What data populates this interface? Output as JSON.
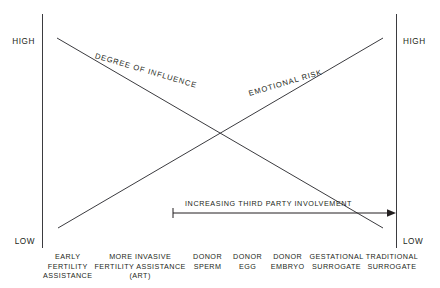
{
  "chart_data": {
    "type": "line",
    "title": "",
    "subtitle": "",
    "xlabel": "",
    "ylabel": "",
    "grid": false,
    "legend_position": "inline-along-lines",
    "axis_scale_labels": {
      "left_top": "HIGH",
      "left_bottom": "LOW",
      "right_top": "HIGH",
      "right_bottom": "LOW"
    },
    "categories": [
      "EARLY FERTILITY ASSISTANCE",
      "MORE INVASIVE FERTILITY ASSISTANCE (ART)",
      "DONOR SPERM",
      "DONOR EGG",
      "DONOR EMBRYO",
      "GESTATIONAL SURROGATE",
      "TRADITIONAL SURROGATE"
    ],
    "series": [
      {
        "name": "DEGREE OF INFLUENCE",
        "trend": "decreasing",
        "values": [
          100,
          83,
          66,
          50,
          33,
          16,
          0
        ]
      },
      {
        "name": "EMOTIONAL RISK",
        "trend": "increasing",
        "values": [
          0,
          16,
          33,
          50,
          66,
          83,
          100
        ]
      }
    ],
    "annotations": [
      {
        "name": "increasing-third-party-involvement",
        "text": "INCREASING THIRD PARTY INVOLVEMENT",
        "type": "arrow",
        "direction": "left-to-right",
        "start_category": "DONOR SPERM",
        "end_category": "TRADITIONAL SURROGATE"
      }
    ],
    "colors": {
      "line": "#3b3b3f",
      "axis": "#3b3b3f",
      "text": "#231f20",
      "background": "#ffffff"
    }
  },
  "axes": {
    "left": {
      "high": "HIGH",
      "low": "LOW"
    },
    "right": {
      "high": "HIGH",
      "low": "LOW"
    }
  },
  "series_labels": {
    "degree_of_influence": "DEGREE OF INFLUENCE",
    "emotional_risk": "EMOTIONAL RISK"
  },
  "annotation": {
    "third_party": "INCREASING THIRD PARTY INVOLVEMENT"
  },
  "categories": [
    {
      "lines": [
        "EARLY",
        "FERTILITY",
        "ASSISTANCE"
      ]
    },
    {
      "lines": [
        "MORE INVASIVE",
        "FERTILITY ASSISTANCE",
        "(ART)"
      ]
    },
    {
      "lines": [
        "DONOR",
        "SPERM"
      ]
    },
    {
      "lines": [
        "DONOR",
        "EGG"
      ]
    },
    {
      "lines": [
        "DONOR",
        "EMBRYO"
      ]
    },
    {
      "lines": [
        "GESTATIONAL",
        "SURROGATE"
      ]
    },
    {
      "lines": [
        "TRADITIONAL",
        "SURROGATE"
      ]
    }
  ]
}
